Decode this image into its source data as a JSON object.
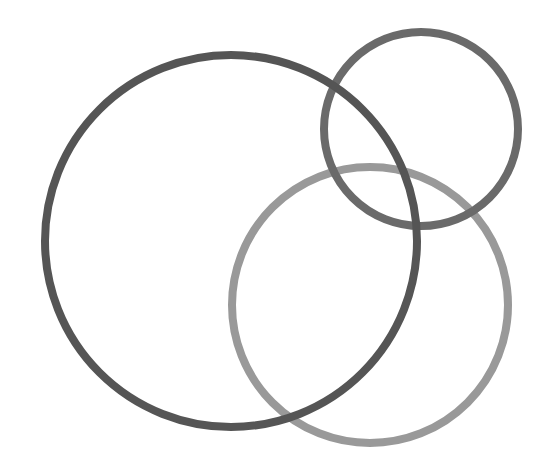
{
  "diagram": {
    "type": "venn-outline",
    "background": "#ffffff",
    "width": 550,
    "height": 467,
    "circles": [
      {
        "name": "light-circle",
        "cx": 370,
        "cy": 305,
        "r": 138,
        "stroke": "#999999",
        "stroke_width": 8
      },
      {
        "name": "small-circle",
        "cx": 421,
        "cy": 129,
        "r": 97,
        "stroke": "#6a6a6a",
        "stroke_width": 8
      },
      {
        "name": "large-circle",
        "cx": 231,
        "cy": 241,
        "r": 186,
        "stroke": "#555555",
        "stroke_width": 8
      }
    ]
  }
}
